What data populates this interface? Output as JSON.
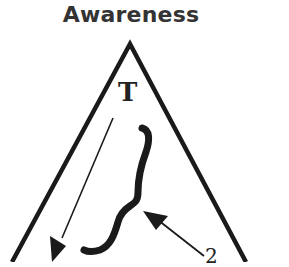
{
  "diagram": {
    "title": "Awareness",
    "vertex_label": "T",
    "partial_label": "2",
    "colors": {
      "stroke": "#1a1a1a",
      "title": "#333333",
      "background": "#ffffff"
    },
    "elements": [
      {
        "type": "triangle",
        "apex": [
          130,
          44
        ],
        "left_edge_end": [
          12,
          262
        ],
        "right_edge_end": [
          246,
          262
        ]
      },
      {
        "type": "arrow",
        "from": [
          113,
          118
        ],
        "to": [
          55,
          255
        ],
        "direction": "down-left"
      },
      {
        "type": "curly-brace",
        "orientation": "left",
        "span": [
          [
            145,
            130
          ],
          [
            80,
            252
          ]
        ]
      },
      {
        "type": "arrow",
        "from": [
          205,
          258
        ],
        "to": [
          145,
          212
        ],
        "direction": "up-left"
      }
    ]
  }
}
